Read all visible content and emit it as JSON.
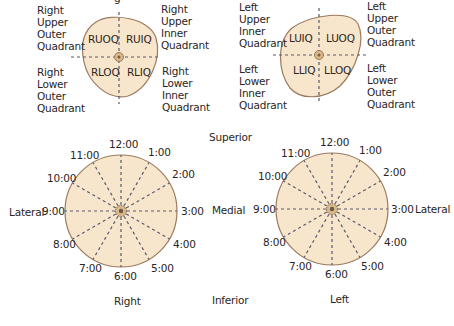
{
  "colors": {
    "breast_fill": "#f8e6cc",
    "outline": "#9b7a5e",
    "dashes": "#5a5a6e",
    "nipple": "#d8b88a",
    "text": "#2a2522"
  },
  "top_cropped_text": "g",
  "right_breast_quadrants": {
    "codes": [
      "RUOQ",
      "RUIQ",
      "RLOQ",
      "RLIQ"
    ],
    "outer_labels": {
      "upper_outer": "Right\nUpper\nOuter\nQuadrant",
      "upper_inner": "Right\nUpper\nInner\nQuadrant",
      "lower_outer": "Right\nLower\nOuter\nQuadrant",
      "lower_inner": "Right\nLower\nInner\nQuadrant"
    }
  },
  "left_breast_quadrants": {
    "codes": [
      "LUIQ",
      "LUOQ",
      "LLIQ",
      "LLOQ"
    ],
    "outer_labels": {
      "upper_inner": "Left\nUpper\nInner\nQuadrant",
      "upper_outer": "Left\nUpper\nOuter\nQuadrant",
      "lower_inner": "Left\nLower\nInner\nQuadrant",
      "lower_outer": "Left\nLower\nOuter\nQuadrant"
    }
  },
  "clock_positions": [
    "12:00",
    "1:00",
    "2:00",
    "3:00",
    "4:00",
    "5:00",
    "6:00",
    "7:00",
    "8:00",
    "9:00",
    "10:00",
    "11:00"
  ],
  "orientation": {
    "superior": "Superior",
    "inferior": "Inferior",
    "medial": "Medial",
    "lateral_right": "Lateral",
    "lateral_left": "Lateral"
  },
  "side_labels": {
    "right": "Right",
    "left": "Left"
  }
}
